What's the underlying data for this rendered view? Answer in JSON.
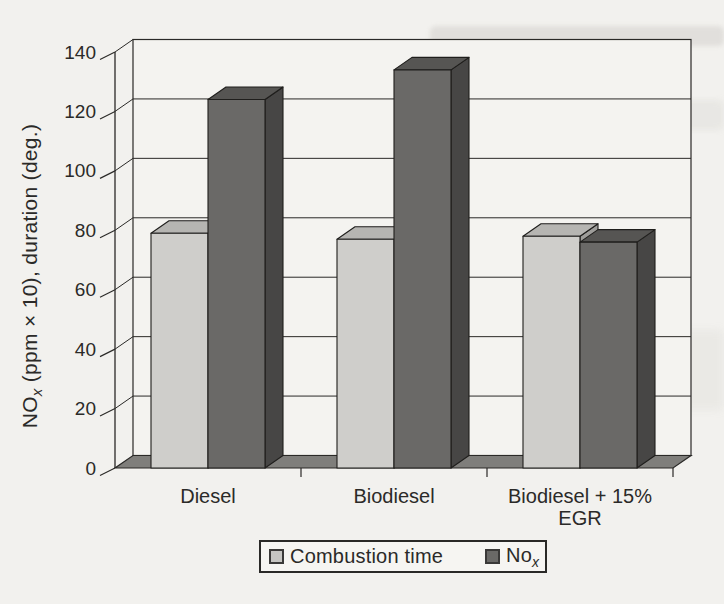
{
  "figure": {
    "kind": "scanned book figure",
    "background": "#f2f1ee"
  },
  "chart_data": {
    "type": "bar",
    "projection": "3d-oblique",
    "title": "",
    "categories": [
      [
        "Diesel"
      ],
      [
        "Biodiesel"
      ],
      [
        "Biodiesel + 15%",
        "EGR"
      ]
    ],
    "series": [
      {
        "name": "Combustion time",
        "values": [
          79,
          77,
          78
        ]
      },
      {
        "name": "NOx",
        "values": [
          124,
          134,
          76
        ]
      }
    ],
    "ylabel": {
      "prefix": "NO",
      "sub": "x",
      "suffix": " (ppm × 10), duration (deg.)"
    },
    "xlabel": "",
    "yticks": [
      0,
      20,
      40,
      60,
      80,
      100,
      120,
      140
    ],
    "ylim": [
      0,
      140
    ],
    "grid": true,
    "legend_position": "bottom-center",
    "legend": [
      {
        "label": "Combustion time",
        "sub": ""
      },
      {
        "label": "No",
        "sub": "x"
      }
    ]
  },
  "colors": {
    "paper": "#f2f1ee",
    "wall": "#f4f3f0",
    "floor": "#7f7e7b",
    "line": "#2a2927",
    "bar_outline": "#1f1e1c",
    "text": "#2b2a28",
    "series_light": {
      "front": "#cfcecb",
      "top": "#b6b5b2",
      "side": "#9e9d9a"
    },
    "series_dark": {
      "front": "#6a6967",
      "top": "#565553",
      "side": "#474645"
    }
  }
}
